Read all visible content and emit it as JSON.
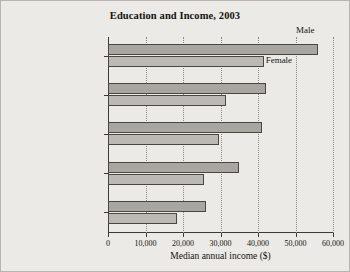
{
  "figure": {
    "title": "Education and Income, 2003",
    "background_color": "#eceae6",
    "border_color": "#b9b6b1"
  },
  "axes": {
    "x_axis_title": "Median annual income ($)",
    "x_tick_labels": [
      "0",
      "10,000",
      "20,000",
      "30,000",
      "40,000",
      "50,000",
      "60,000"
    ],
    "y_tick_labels": [
      "Bachelor's degree",
      "Associate degree",
      "Some college",
      "High school diploma",
      "Some high school"
    ]
  },
  "series_labels": {
    "male": "Male",
    "female": "Female"
  },
  "chart_data": {
    "type": "bar",
    "orientation": "horizontal",
    "title": "Education and Income, 2003",
    "xlabel": "Median annual income ($)",
    "ylabel": "",
    "xlim": [
      0,
      60000
    ],
    "xticks": [
      0,
      10000,
      20000,
      30000,
      40000,
      50000,
      60000
    ],
    "grid": "vertical-dotted",
    "legend_position": "inline-annotations",
    "categories": [
      "Bachelor's degree",
      "Associate degree",
      "Some college",
      "High school diploma",
      "Some high school"
    ],
    "series": [
      {
        "name": "Male",
        "color": "#a9a6a1",
        "values": [
          56000,
          42000,
          41000,
          35000,
          26000
        ]
      },
      {
        "name": "Female",
        "color": "#bcb9b4",
        "values": [
          41500,
          31500,
          29500,
          25500,
          18500
        ]
      }
    ]
  }
}
